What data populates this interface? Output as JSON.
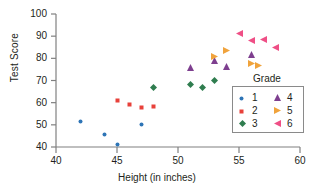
{
  "chart_data": {
    "type": "scatter",
    "title": "",
    "xlabel": "Height (in inches)",
    "ylabel": "Test Score",
    "xlim": [
      40,
      60
    ],
    "ylim": [
      40,
      100
    ],
    "xticks": [
      "40",
      "45",
      "50",
      "55",
      "60"
    ],
    "yticks": [
      "40",
      "50",
      "60",
      "70",
      "80",
      "90",
      "100"
    ],
    "grid": false,
    "legend_position": "inside-lower-right",
    "legend_title": "Grade",
    "series": [
      {
        "name": "1",
        "marker": "circle",
        "color": "#2e75b6",
        "points": [
          [
            42,
            55.5
          ],
          [
            44,
            49.8
          ],
          [
            45,
            45.0
          ],
          [
            47,
            54.0
          ]
        ]
      },
      {
        "name": "2",
        "marker": "square",
        "color": "#e8413a",
        "points": [
          [
            45,
            65.0
          ],
          [
            46,
            63.2
          ],
          [
            47,
            62.0
          ],
          [
            48,
            62.2
          ]
        ]
      },
      {
        "name": "3",
        "marker": "diamond",
        "color": "#2f7d4f",
        "points": [
          [
            48,
            70.2
          ],
          [
            51,
            71.2
          ],
          [
            52,
            70.2
          ],
          [
            53,
            73.0
          ]
        ]
      },
      {
        "name": "4",
        "marker": "triangle-up",
        "color": "#7e3f8f",
        "points": [
          [
            51,
            79.2
          ],
          [
            53,
            82.0
          ],
          [
            54,
            79.6
          ],
          [
            56,
            85.0
          ]
        ]
      },
      {
        "name": "5",
        "marker": "triangle-right",
        "color": "#f0a33c",
        "points": [
          [
            53,
            84.2
          ],
          [
            54,
            86.8
          ],
          [
            56,
            81.0
          ],
          [
            56.6,
            80.0
          ]
        ]
      },
      {
        "name": "6",
        "marker": "triangle-left",
        "color": "#ef4f86",
        "points": [
          [
            55,
            94.5
          ],
          [
            56,
            91.0
          ],
          [
            57,
            91.8
          ],
          [
            58,
            88.0
          ]
        ]
      }
    ]
  },
  "axes": {
    "x_label": "Height (in inches)",
    "y_label": "Test Score"
  },
  "legend": {
    "title": "Grade",
    "entries": [
      {
        "label": "1"
      },
      {
        "label": "2"
      },
      {
        "label": "3"
      },
      {
        "label": "4"
      },
      {
        "label": "5"
      },
      {
        "label": "6"
      }
    ]
  }
}
